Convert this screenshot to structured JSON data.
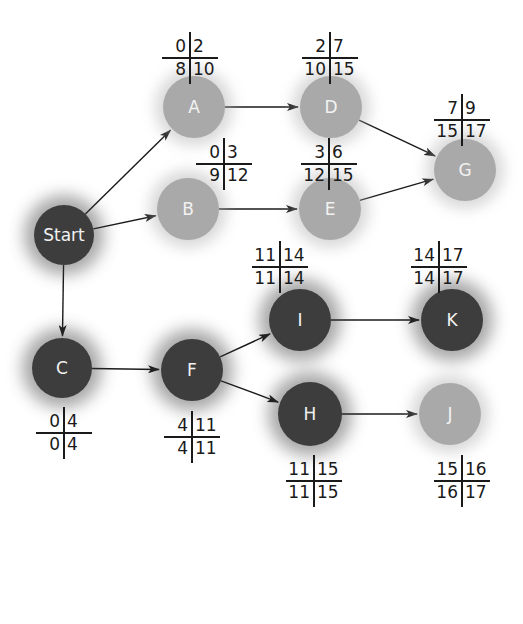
{
  "diagram": {
    "type": "activity-on-node network (critical path)",
    "cell_legend": [
      "early start",
      "early finish",
      "late start",
      "late finish"
    ],
    "nodes": [
      {
        "id": "start",
        "label": "Start",
        "x": 64,
        "y": 235,
        "r": 30,
        "tone": "dark"
      },
      {
        "id": "A",
        "label": "A",
        "x": 194,
        "y": 107,
        "r": 31,
        "tone": "light",
        "table": {
          "x": 162,
          "y": 36,
          "es": "0",
          "ef": "2",
          "ls": "8",
          "lf": "10"
        }
      },
      {
        "id": "D",
        "label": "D",
        "x": 331,
        "y": 107,
        "r": 31,
        "tone": "light",
        "table": {
          "x": 302,
          "y": 36,
          "es": "2",
          "ef": "7",
          "ls": "10",
          "lf": "15"
        }
      },
      {
        "id": "G",
        "label": "G",
        "x": 465,
        "y": 170,
        "r": 31,
        "tone": "light",
        "table": {
          "x": 434,
          "y": 98,
          "es": "7",
          "ef": "9",
          "ls": "15",
          "lf": "17"
        }
      },
      {
        "id": "B",
        "label": "B",
        "x": 188,
        "y": 209,
        "r": 31,
        "tone": "light",
        "table": {
          "x": 196,
          "y": 142,
          "es": "0",
          "ef": "3",
          "ls": "9",
          "lf": "12"
        }
      },
      {
        "id": "E",
        "label": "E",
        "x": 330,
        "y": 209,
        "r": 31,
        "tone": "light",
        "table": {
          "x": 301,
          "y": 142,
          "es": "3",
          "ef": "6",
          "ls": "12",
          "lf": "15"
        }
      },
      {
        "id": "I",
        "label": "I",
        "x": 300,
        "y": 320,
        "r": 31,
        "tone": "dark",
        "table": {
          "x": 252,
          "y": 245,
          "es": "11",
          "ef": "14",
          "ls": "11",
          "lf": "14"
        }
      },
      {
        "id": "K",
        "label": "K",
        "x": 452,
        "y": 320,
        "r": 31,
        "tone": "dark",
        "table": {
          "x": 411,
          "y": 245,
          "es": "14",
          "ef": "17",
          "ls": "14",
          "lf": "17"
        }
      },
      {
        "id": "C",
        "label": "C",
        "x": 62,
        "y": 368,
        "r": 30,
        "tone": "dark",
        "table": {
          "x": 36,
          "y": 411,
          "es": "0",
          "ef": "4",
          "ls": "0",
          "lf": "4"
        }
      },
      {
        "id": "F",
        "label": "F",
        "x": 192,
        "y": 370,
        "r": 31,
        "tone": "dark",
        "table": {
          "x": 164,
          "y": 415,
          "es": "4",
          "ef": "11",
          "ls": "4",
          "lf": "11"
        }
      },
      {
        "id": "H",
        "label": "H",
        "x": 310,
        "y": 414,
        "r": 32,
        "tone": "dark",
        "table": {
          "x": 286,
          "y": 459,
          "es": "11",
          "ef": "15",
          "ls": "11",
          "lf": "15"
        }
      },
      {
        "id": "J",
        "label": "J",
        "x": 450,
        "y": 414,
        "r": 31,
        "tone": "light",
        "table": {
          "x": 434,
          "y": 459,
          "es": "15",
          "ef": "16",
          "ls": "16",
          "lf": "17"
        }
      }
    ],
    "edges": [
      {
        "from": "start",
        "to": "A"
      },
      {
        "from": "start",
        "to": "B"
      },
      {
        "from": "start",
        "to": "C"
      },
      {
        "from": "A",
        "to": "D"
      },
      {
        "from": "D",
        "to": "G"
      },
      {
        "from": "B",
        "to": "E"
      },
      {
        "from": "E",
        "to": "G"
      },
      {
        "from": "C",
        "to": "F"
      },
      {
        "from": "F",
        "to": "I"
      },
      {
        "from": "F",
        "to": "H"
      },
      {
        "from": "I",
        "to": "K"
      },
      {
        "from": "H",
        "to": "J"
      }
    ],
    "colors": {
      "light_node": "#a9a9a9",
      "dark_node": "#3d3d3d",
      "edge": "#1a1a1a",
      "node_text": "#f2f2f2"
    }
  }
}
